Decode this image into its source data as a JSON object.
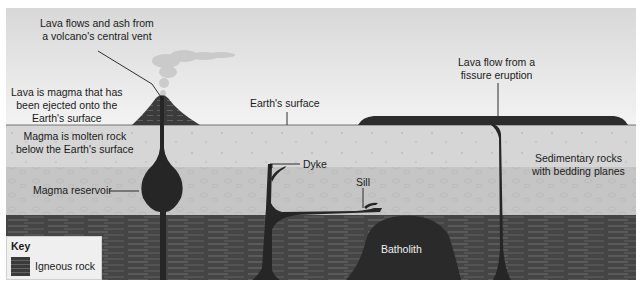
{
  "diagram": {
    "labels": {
      "central_vent": [
        "Lava flows and ash from",
        "a volcano's central vent"
      ],
      "lava_definition": [
        "Lava is magma that has",
        "been ejected onto the",
        "Earth's surface"
      ],
      "earth_surface": "Earth's surface",
      "fissure": [
        "Lava flow from a",
        "fissure eruption"
      ],
      "magma_definition": [
        "Magma is molten rock",
        "below the Earth's surface"
      ],
      "magma_reservoir": "Magma reservoir",
      "dyke": "Dyke",
      "sill": "Sill",
      "sedimentary": [
        "Sedimentary rocks",
        "with bedding planes"
      ],
      "batholith": "Batholith"
    },
    "key": {
      "title": "Key",
      "items": [
        {
          "label": "Igneous rock",
          "swatch_color": "#3a3a3a"
        }
      ]
    },
    "colors": {
      "sky_top": "#d9d9d9",
      "sky_bottom": "#f4f4f4",
      "sediment_upper": "#d6d6d6",
      "sediment_middle": "#c4c4c4",
      "igneous_layer": "#454545",
      "magma": "#262626"
    }
  }
}
